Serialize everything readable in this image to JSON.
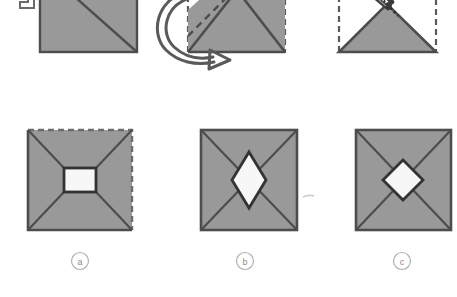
{
  "figure": {
    "background_color": "#ffffff",
    "paper_fill": "#999999",
    "paper_edge_color": "#4d4d4d",
    "fold_line_color": "#4d4d4d",
    "cut_hole_fill": "#f7f7f7",
    "arrow_color": "#595959",
    "label_color": "#8a8a8a",
    "width": 457,
    "height": 297
  },
  "steps": {
    "step1": {
      "name": "step-1-square-folded-once",
      "description": "Square sheet of paper with a single diagonal crease from the top-left corner to the bottom-right corner",
      "fold_style": "solid-diagonal",
      "corner_icon": "fold-corner-icon"
    },
    "step2": {
      "name": "step-2-fold-again",
      "description": "Paper folded to a triangle, with the original square shown as a dashed outline and a dashed crease line; a curved arrow shows the next fold direction",
      "outline_style": "dashed",
      "crease_style": "dashed",
      "arrow_icon": "curved-fold-arrow-icon"
    },
    "step3": {
      "name": "step-3-cut-with-scissors",
      "description": "Folded triangle with the original square as a dashed outline; scissors cut the folded tip along a dotted cut line",
      "outline_style": "dashed",
      "cut_line_style": "dotted",
      "tool_icon": "scissors-icon"
    }
  },
  "results": {
    "caption_style": "circled-letter",
    "items": [
      {
        "id": "result-a",
        "label": "a",
        "hole_shape": "square",
        "hole_name": "square-hole",
        "description": "Unfolded square with creases radiating from the four corners to a square hole in the centre",
        "square_outline": "two-dashed-edges",
        "dashed_edges": [
          "top",
          "right"
        ]
      },
      {
        "id": "result-b",
        "label": "b",
        "hole_shape": "tall-rhombus",
        "hole_name": "rhombus-hole",
        "description": "Unfolded square with X creases and a tall vertical rhombus hole in the centre",
        "square_outline": "solid"
      },
      {
        "id": "result-c",
        "label": "c",
        "hole_shape": "diamond",
        "hole_name": "diamond-hole",
        "description": "Unfolded square with X creases and a diamond (square rotated 45 degrees) hole in the centre",
        "square_outline": "solid"
      }
    ]
  }
}
